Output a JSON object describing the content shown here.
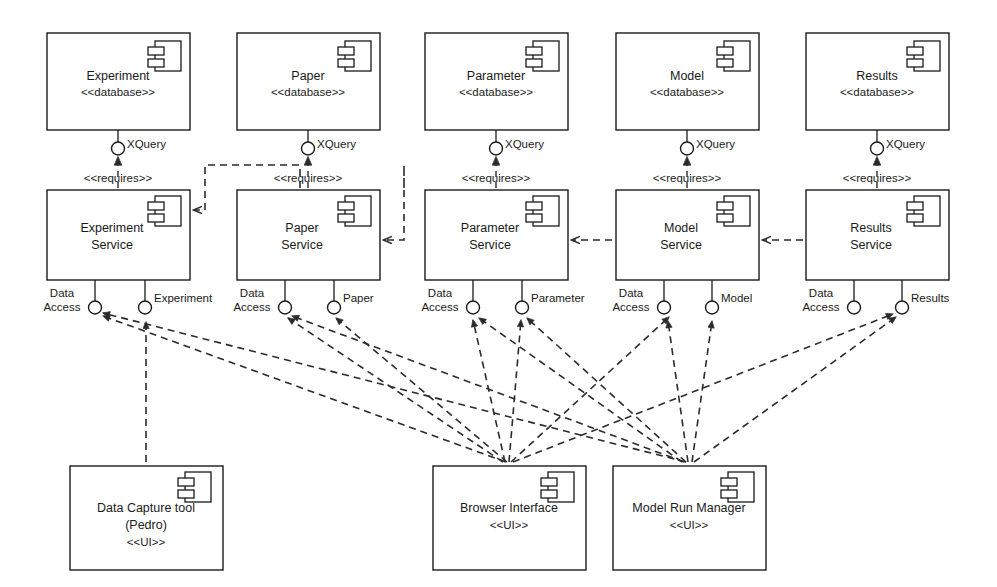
{
  "diagram": {
    "notation": "UML component diagram",
    "stereotype_database": "<<database>>",
    "stereotype_ui": "<<UI>>",
    "stereotype_requires": "<<requires>>",
    "interface_xquery": "XQuery",
    "interface_data_access_line1": "Data",
    "interface_data_access_line2": "Access"
  },
  "databases": [
    {
      "id": "db-experiment",
      "name": "Experiment",
      "stereotype": "<<database>>",
      "x": 47,
      "y": 33,
      "w": 143,
      "h": 97
    },
    {
      "id": "db-paper",
      "name": "Paper",
      "stereotype": "<<database>>",
      "x": 237,
      "y": 33,
      "w": 143,
      "h": 97
    },
    {
      "id": "db-parameter",
      "name": "Parameter",
      "stereotype": "<<database>>",
      "x": 425,
      "y": 33,
      "w": 143,
      "h": 97
    },
    {
      "id": "db-model",
      "name": "Model",
      "stereotype": "<<database>>",
      "x": 616,
      "y": 33,
      "w": 143,
      "h": 97
    },
    {
      "id": "db-results",
      "name": "Results",
      "stereotype": "<<database>>",
      "x": 806,
      "y": 33,
      "w": 143,
      "h": 97
    }
  ],
  "services": [
    {
      "id": "svc-experiment",
      "line1": "Experiment",
      "line2": "Service",
      "x": 47,
      "y": 190,
      "w": 143,
      "h": 90,
      "provided": [
        {
          "name_line1": "Data",
          "name_line2": "Access",
          "label": "Data Access",
          "cx": 95
        },
        {
          "name_line1": "Experiment",
          "name_line2": "",
          "label": "Experiment",
          "cx": 145
        }
      ]
    },
    {
      "id": "svc-paper",
      "line1": "Paper",
      "line2": "Service",
      "x": 237,
      "y": 190,
      "w": 143,
      "h": 90,
      "provided": [
        {
          "name_line1": "Data",
          "name_line2": "Access",
          "label": "Data Access",
          "cx": 285
        },
        {
          "name_line1": "Paper",
          "name_line2": "",
          "label": "Paper",
          "cx": 334
        }
      ]
    },
    {
      "id": "svc-parameter",
      "line1": "Parameter",
      "line2": "Service",
      "x": 425,
      "y": 190,
      "w": 143,
      "h": 90,
      "provided": [
        {
          "name_line1": "Data",
          "name_line2": "Access",
          "label": "Data Access",
          "cx": 473
        },
        {
          "name_line1": "Parameter",
          "name_line2": "",
          "label": "Parameter",
          "cx": 522
        }
      ]
    },
    {
      "id": "svc-model",
      "line1": "Model",
      "line2": "Service",
      "x": 616,
      "y": 190,
      "w": 143,
      "h": 90,
      "provided": [
        {
          "name_line1": "Data",
          "name_line2": "Access",
          "label": "Data Access",
          "cx": 664
        },
        {
          "name_line1": "Model",
          "name_line2": "",
          "label": "Model",
          "cx": 712
        }
      ]
    },
    {
      "id": "svc-results",
      "line1": "Results",
      "line2": "Service",
      "x": 806,
      "y": 190,
      "w": 143,
      "h": 90,
      "provided": [
        {
          "name_line1": "Data",
          "name_line2": "Access",
          "label": "Data Access",
          "cx": 854
        },
        {
          "name_line1": "Results",
          "name_line2": "",
          "label": "Results",
          "cx": 902
        }
      ]
    }
  ],
  "ui_components": [
    {
      "id": "ui-pedro",
      "line1": "Data Capture tool",
      "line2": "(Pedro)",
      "line3": "<<UI>>",
      "x": 70,
      "y": 466,
      "w": 153,
      "h": 104
    },
    {
      "id": "ui-browser",
      "line1": "Browser Interface",
      "line2": "<<UI>>",
      "line3": "",
      "x": 433,
      "y": 466,
      "w": 153,
      "h": 104
    },
    {
      "id": "ui-mrm",
      "line1": "Model Run Manager",
      "line2": "<<UI>>",
      "line3": "",
      "x": 613,
      "y": 466,
      "w": 153,
      "h": 104
    }
  ],
  "requires_links": [
    {
      "id": "req-experiment",
      "label": "<<requires>>",
      "from": "svc-experiment",
      "to": "db-experiment",
      "interface": "XQuery"
    },
    {
      "id": "req-paper",
      "label": "<<requires>>",
      "from": "svc-paper",
      "to": "db-paper",
      "interface": "XQuery"
    },
    {
      "id": "req-parameter",
      "label": "<<requires>>",
      "from": "svc-parameter",
      "to": "db-parameter",
      "interface": "XQuery"
    },
    {
      "id": "req-model",
      "label": "<<requires>>",
      "from": "svc-model",
      "to": "db-model",
      "interface": "XQuery"
    },
    {
      "id": "req-results",
      "label": "<<requires>>",
      "from": "svc-results",
      "to": "db-results",
      "interface": "XQuery"
    }
  ],
  "service_dependencies": [
    {
      "from": "svc-paper",
      "to": "svc-experiment"
    },
    {
      "from": "svc-parameter",
      "to": "svc-paper"
    },
    {
      "from": "svc-model",
      "to": "svc-parameter"
    },
    {
      "from": "svc-results",
      "to": "svc-model"
    }
  ],
  "ui_dependencies": [
    {
      "from": "ui-pedro",
      "to": "svc-experiment",
      "interface": "Experiment"
    },
    {
      "from": "ui-browser",
      "to": "svc-experiment",
      "interface": "Data Access"
    },
    {
      "from": "ui-browser",
      "to": "svc-paper",
      "interface": "Data Access"
    },
    {
      "from": "ui-browser",
      "to": "svc-paper",
      "interface": "Paper"
    },
    {
      "from": "ui-browser",
      "to": "svc-parameter",
      "interface": "Data Access"
    },
    {
      "from": "ui-browser",
      "to": "svc-parameter",
      "interface": "Parameter"
    },
    {
      "from": "ui-browser",
      "to": "svc-model",
      "interface": "Data Access"
    },
    {
      "from": "ui-browser",
      "to": "svc-results",
      "interface": "Data Access"
    },
    {
      "from": "ui-mrm",
      "to": "svc-experiment",
      "interface": "Data Access"
    },
    {
      "from": "ui-mrm",
      "to": "svc-paper",
      "interface": "Data Access"
    },
    {
      "from": "ui-mrm",
      "to": "svc-parameter",
      "interface": "Data Access"
    },
    {
      "from": "ui-mrm",
      "to": "svc-parameter",
      "interface": "Parameter"
    },
    {
      "from": "ui-mrm",
      "to": "svc-model",
      "interface": "Data Access"
    },
    {
      "from": "ui-mrm",
      "to": "svc-model",
      "interface": "Model"
    },
    {
      "from": "ui-mrm",
      "to": "svc-results",
      "interface": "Results"
    }
  ],
  "colors": {
    "background": "#ffffff",
    "stroke": "#1a1a1a",
    "dash": "#2b2b2b"
  }
}
